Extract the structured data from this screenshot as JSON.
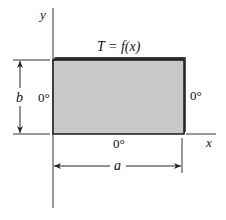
{
  "diagram": {
    "axes": {
      "x_label": "x",
      "y_label": "y"
    },
    "plate": {
      "fill_color": "#c8c8c8",
      "edge_color": "#1a1a1a"
    },
    "boundary_conditions": {
      "top": "T = f(x)",
      "left": "0°",
      "right": "0°",
      "bottom": "0°"
    },
    "dimensions": {
      "width_label": "a",
      "height_label": "b"
    }
  }
}
